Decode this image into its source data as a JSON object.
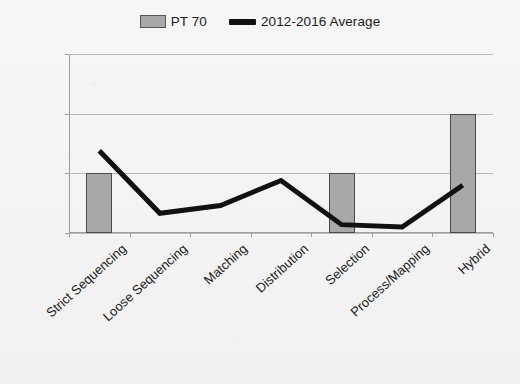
{
  "chart_data": {
    "type": "bar",
    "title": "",
    "subtitle": "",
    "xlabel": "",
    "ylabel": "",
    "ylim": [
      0,
      3
    ],
    "yticks": [
      0,
      1,
      2,
      3
    ],
    "grid": true,
    "legend_position": "top-center",
    "categories": [
      "Strict Sequencing",
      "Loose Sequencing",
      "Matching",
      "Distribution",
      "Selection",
      "Process/Mapping",
      "Hybrid"
    ],
    "series": [
      {
        "name": "PT 70",
        "type": "bar",
        "color": "#a8a8a8",
        "values": [
          1,
          0,
          0,
          0,
          1,
          0,
          2
        ]
      },
      {
        "name": "2012-2016 Average",
        "type": "line",
        "color": "#111111",
        "values": [
          1.38,
          0.33,
          0.46,
          0.88,
          0.14,
          0.1,
          0.8
        ]
      }
    ]
  },
  "legend": {
    "items": [
      {
        "label": "PT 70",
        "marker": "bar-swatch-icon"
      },
      {
        "label": "2012-2016 Average",
        "marker": "line-swatch-icon"
      }
    ]
  },
  "axis": {
    "y_tick_labels": [
      "0",
      "1",
      "2",
      "3"
    ]
  }
}
